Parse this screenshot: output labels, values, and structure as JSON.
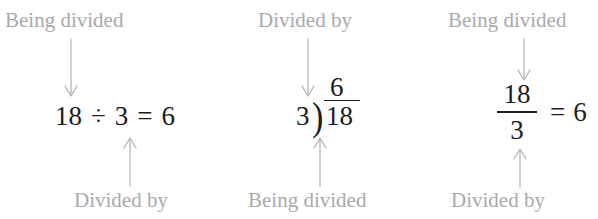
{
  "figure": {
    "label_color": "#a9a9ad",
    "expression_color": "#1c1c1c",
    "arrow_color": "#b2b2b6",
    "background_color": "#ffffff"
  },
  "panels": [
    {
      "id": "obelus",
      "top_label": "Being divided",
      "bottom_label": "Divided by",
      "expression": {
        "notation": "inline-obelus",
        "dividend": "18",
        "operator": "÷",
        "divisor": "3",
        "equals": "=",
        "quotient": "6",
        "text": "18 ÷ 3 = 6"
      },
      "top_arrow": {
        "direction": "down",
        "points_to": "dividend"
      },
      "bottom_arrow": {
        "direction": "up",
        "points_to": "divisor"
      }
    },
    {
      "id": "long-division",
      "top_label": "Divided by",
      "bottom_label": "Being divided",
      "expression": {
        "notation": "long-division",
        "divisor": "3",
        "bracket": ")",
        "dividend": "18",
        "quotient": "6",
        "text": "3)18 with quotient 6"
      },
      "top_arrow": {
        "direction": "down",
        "points_to": "divisor"
      },
      "bottom_arrow": {
        "direction": "up",
        "points_to": "dividend"
      }
    },
    {
      "id": "fraction",
      "top_label": "Being divided",
      "bottom_label": "Divided by",
      "expression": {
        "notation": "stacked-fraction",
        "numerator": "18",
        "denominator": "3",
        "equals": "=",
        "quotient": "6",
        "text": "18/3 = 6"
      },
      "top_arrow": {
        "direction": "down",
        "points_to": "numerator"
      },
      "bottom_arrow": {
        "direction": "up",
        "points_to": "denominator"
      }
    }
  ]
}
